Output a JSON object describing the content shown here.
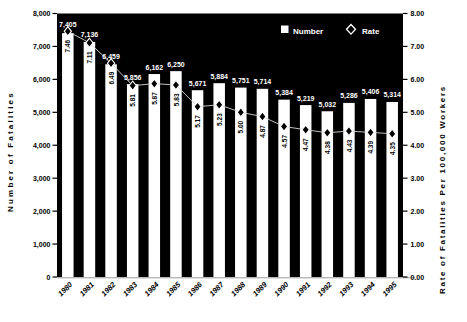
{
  "figure": {
    "left_axis_title": "Number of Fatalities",
    "right_axis_title": "Rate of Fatalities Per 100,000 Workers"
  },
  "legend": {
    "number_label": "Number",
    "rate_label": "Rate"
  },
  "chart_data": {
    "type": "bar",
    "subtype": "bar-with-rate-line-combo",
    "categories": [
      "1980",
      "1981",
      "1982",
      "1983",
      "1984",
      "1985",
      "1986",
      "1987",
      "1988",
      "1989",
      "1990",
      "1991",
      "1992",
      "1993",
      "1994",
      "1995"
    ],
    "series": [
      {
        "name": "Number",
        "axis": "left",
        "type": "bar",
        "values": [
          7405,
          7136,
          6459,
          5856,
          6162,
          6250,
          5671,
          5884,
          5751,
          5714,
          5384,
          5219,
          5032,
          5286,
          5406,
          5314
        ],
        "labels": [
          "7,405",
          "7,136",
          "6,459",
          "5,856",
          "6,162",
          "6,250",
          "5,671",
          "5,884",
          "5,751",
          "5,714",
          "5,384",
          "5,219",
          "5,032",
          "5,286",
          "5,406",
          "5,314"
        ]
      },
      {
        "name": "Rate",
        "axis": "right",
        "type": "line",
        "marker": "diamond",
        "values": [
          7.46,
          7.11,
          6.49,
          5.81,
          5.87,
          5.83,
          5.17,
          5.23,
          5.0,
          4.87,
          4.57,
          4.47,
          4.38,
          4.43,
          4.39,
          4.35
        ],
        "labels": [
          "7.46",
          "7.11",
          "6.49",
          "5.81",
          "5.87",
          "5.83",
          "5.17",
          "5.23",
          "5.00",
          "4.87",
          "4.57",
          "4.47",
          "4.38",
          "4.43",
          "4.39",
          "4.35"
        ]
      }
    ],
    "left_axis": {
      "label": "Number of Fatalities",
      "min": 0,
      "max": 8000,
      "step": 1000,
      "tick_labels": [
        "0",
        "1,000",
        "2,000",
        "3,000",
        "4,000",
        "5,000",
        "6,000",
        "7,000",
        "8,000"
      ]
    },
    "right_axis": {
      "label": "Rate of Fatalities Per 100,000 Workers",
      "min": 0,
      "max": 8,
      "step": 1,
      "tick_labels": [
        "0.00",
        "1.00",
        "2.00",
        "3.00",
        "4.00",
        "5.00",
        "6.00",
        "7.00",
        "8.00"
      ]
    },
    "legend_position": "top-right-inside",
    "grid": false,
    "colors": {
      "page_bg": "#ffffff",
      "plot_bg": "#000000",
      "bar_fill": "#ffffff",
      "marker_fill": "#000000",
      "marker_stroke": "#ffffff",
      "bar_value_label": "#ffffff",
      "rate_value_label": "#000000",
      "rate_line": "#d4d4d4",
      "axis_text": "#000000"
    }
  }
}
